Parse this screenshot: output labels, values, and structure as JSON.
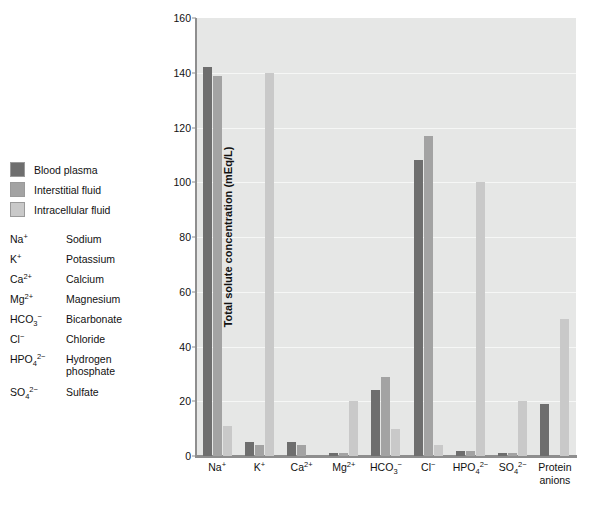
{
  "legend": {
    "items": [
      {
        "label": "Blood plasma",
        "color": "#6e6e6e"
      },
      {
        "label": "Interstitial fluid",
        "color": "#a3a3a3"
      },
      {
        "label": "Intracellular fluid",
        "color": "#c9c9c9"
      }
    ]
  },
  "ion_key": [
    {
      "symbol_html": "Na<sup>+</sup>",
      "name": "Sodium"
    },
    {
      "symbol_html": "K<sup>+</sup>",
      "name": "Potassium"
    },
    {
      "symbol_html": "Ca<sup>2+</sup>",
      "name": "Calcium"
    },
    {
      "symbol_html": "Mg<sup>2+</sup>",
      "name": "Magnesium"
    },
    {
      "symbol_html": "HCO<sub>3</sub><sup>&#8722;</sup>",
      "name": "Bicarbonate"
    },
    {
      "symbol_html": "Cl<sup>&#8722;</sup>",
      "name": "Chloride"
    },
    {
      "symbol_html": "HPO<sub>4</sub><sup>2&#8722;</sup>",
      "name": "Hydrogen phosphate"
    },
    {
      "symbol_html": "SO<sub>4</sub><sup>2&#8722;</sup>",
      "name": "Sulfate"
    }
  ],
  "chart_data": {
    "type": "bar",
    "title": "",
    "xlabel": "",
    "ylabel": "Total solute concentration (mEq/L)",
    "ylim": [
      0,
      160
    ],
    "yticks": [
      0,
      20,
      40,
      60,
      80,
      100,
      120,
      140,
      160
    ],
    "grid": true,
    "legend_position": "left-outside",
    "categories": [
      "Na<sup>+</sup>",
      "K<sup>+</sup>",
      "Ca<sup>2+</sup>",
      "Mg<sup>2+</sup>",
      "HCO<sub>3</sub><sup>&#8722;</sup>",
      "Cl<sup>&#8722;</sup>",
      "HPO<sub>4</sub><sup>2&#8722;</sup>",
      "SO<sub>4</sub><sup>2&#8722;</sup>",
      "Protein<br>anions"
    ],
    "series": [
      {
        "name": "Blood plasma",
        "color": "#6e6e6e",
        "values": [
          142,
          5,
          5,
          1,
          24,
          108,
          2,
          1,
          19
        ]
      },
      {
        "name": "Interstitial fluid",
        "color": "#a3a3a3",
        "values": [
          139,
          4,
          4,
          1,
          29,
          117,
          2,
          1,
          0
        ]
      },
      {
        "name": "Intracellular fluid",
        "color": "#c9c9c9",
        "values": [
          11,
          140,
          0,
          20,
          10,
          4,
          100,
          20,
          50
        ]
      }
    ]
  }
}
